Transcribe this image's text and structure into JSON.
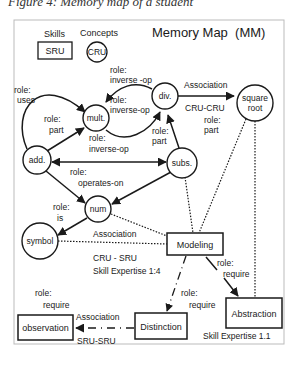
{
  "caption": "Figure 4: Memory map of a student",
  "header": {
    "title": "Memory Map  (MM)",
    "legend_skills_label": "Skills",
    "legend_concepts_label": "Concepts",
    "legend_skill_box": "SRU",
    "legend_concept_circle": "CRU"
  },
  "concepts": {
    "mult": "mult.",
    "div": "div.",
    "square_root_1": "square",
    "square_root_2": "root",
    "add": "add.",
    "subs": "subs.",
    "num": "num",
    "symbol": "symbol"
  },
  "skills": {
    "modeling": "Modeling",
    "abstraction": "Abstraction",
    "distinction": "Distinction",
    "observation": "observation"
  },
  "edge_labels": {
    "role": "role:",
    "uses": "uses",
    "part": "part",
    "inverse_op": "inverse-op",
    "inverse_op_spaced": "inverse -op",
    "operates_on": "operates-on",
    "is": "is",
    "require": "require",
    "association": "Association",
    "cru_cru": "CRU-CRU",
    "cru_sru": "CRU - SRU",
    "sru_sru": "SRU-SRU",
    "skill_expertise_14": "Skill Expertise 1:4",
    "skill_expertise_11": "Skill Expertise 1.1"
  },
  "colors": {
    "stroke": "#1a1a1a",
    "frame": "#bbbbbb",
    "background": "#ffffff"
  }
}
